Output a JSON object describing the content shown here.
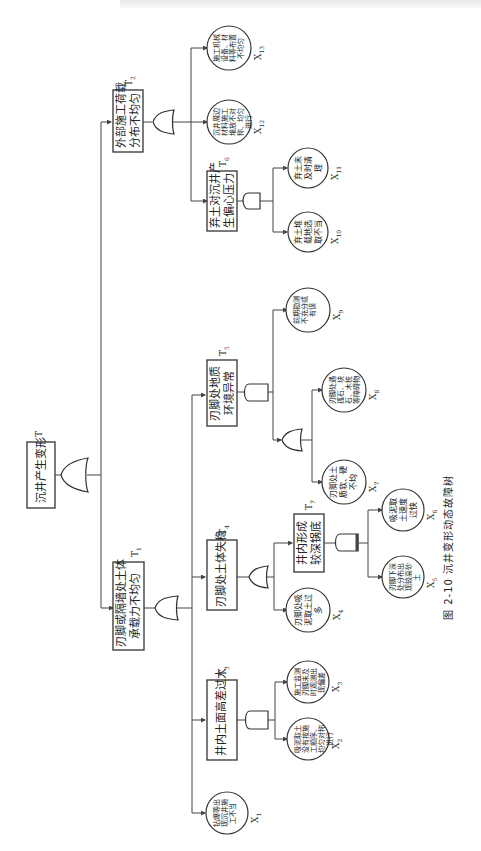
{
  "figure": {
    "caption": "图 2-10   沉井变形动态故障树",
    "orientation": "rotated -90deg"
  },
  "nodes": {
    "top": {
      "id": "T",
      "label": "沉井产生变形",
      "gate": "OR"
    },
    "T1": {
      "id": "T1",
      "label": "刃脚或隔墙处土体承载力不均匀",
      "line1": "刃脚或隔墙处土体",
      "line2": "承载力不均匀",
      "gate": "OR"
    },
    "T2": {
      "id": "T2",
      "label": "外部施工荷载分布不均匀",
      "line1": "外部施工荷载",
      "line2": "分布不均匀",
      "gate": "OR"
    },
    "T3": {
      "id": "T3",
      "label": "井内土面高差过大",
      "gate": "AND"
    },
    "T4": {
      "id": "T4",
      "label": "刃脚处土体失稳",
      "gate": "OR"
    },
    "T5": {
      "id": "T5",
      "label": "刃脚处地质环境异常",
      "line1": "刃脚处地质",
      "line2": "环境异常",
      "gate": "AND"
    },
    "T6": {
      "id": "T6",
      "label": "弃土对沉井产生偏心压力",
      "line1": "弃土对沉井产",
      "line2": "生偏心压力",
      "gate": "AND"
    },
    "T7": {
      "id": "T7",
      "label": "井内形成较深锅底",
      "line1": "井内形成",
      "line2": "较深锅底",
      "gate": "PRIORITY-AND"
    },
    "T5_sub": {
      "gate": "OR"
    }
  },
  "events": {
    "X1": {
      "id": "X1",
      "label": "钻爆等出现沉井施工不当"
    },
    "X2": {
      "id": "X2",
      "label": "吸泥取土没有按施工顺序、均匀对称进行"
    },
    "X3": {
      "id": "X3",
      "label": "施工监测刃脚未及时观测出现偏差"
    },
    "X4": {
      "id": "X4",
      "label": "刃脚处吸泥取土过多"
    },
    "X5": {
      "id": "X5",
      "label": "刃脚下深处分布出现较高砂土"
    },
    "X6": {
      "id": "X6",
      "label": "吸泥取土速度过快"
    },
    "X7": {
      "id": "X7",
      "label": "刃脚处土质软、硬不均"
    },
    "X8": {
      "id": "X8",
      "label": "刃脚处遇孤石、块石、木桩等障碍物"
    },
    "X9": {
      "id": "X9",
      "label": "前期勘测不充分或有误"
    },
    "X10": {
      "id": "X10",
      "label": "弃土堆载地选取不当"
    },
    "X11": {
      "id": "X11",
      "label": "弃土未及时清理"
    },
    "X12": {
      "id": "X12",
      "label": "沉井周边材料施工堆放不对称、均匀进行"
    },
    "X13": {
      "id": "X13",
      "label": "施工机械设备、材料等布置不均匀"
    }
  },
  "colors": {
    "line": "#444444",
    "stroke": "#333333",
    "text": "#222222",
    "background": "#ffffff"
  }
}
